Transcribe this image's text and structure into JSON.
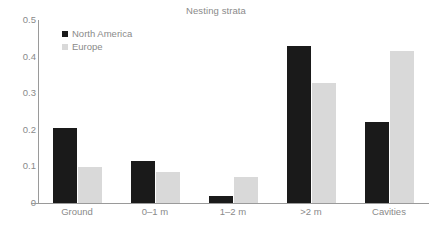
{
  "chart_data": {
    "type": "bar",
    "title": "Nesting strata",
    "xlabel": "",
    "ylabel": "",
    "categories": [
      "Ground",
      "0–1 m",
      "1–2 m",
      ">2 m",
      "Cavities"
    ],
    "series": [
      {
        "name": "North America",
        "color": "#1a1a1a",
        "values": [
          0.205,
          0.115,
          0.018,
          0.429,
          0.222
        ]
      },
      {
        "name": "Europe",
        "color": "#d9d9d9",
        "values": [
          0.098,
          0.085,
          0.071,
          0.327,
          0.414
        ]
      }
    ],
    "ylim": [
      0,
      0.5
    ],
    "yticks": [
      "0",
      "0.1",
      "0.2",
      "0.3",
      "0.4",
      "0.5"
    ],
    "ytick_values": [
      0,
      0.1,
      0.2,
      0.3,
      0.4,
      0.5
    ],
    "grid": false,
    "legend_position": "top-left",
    "axis_color": "#9a9a9a",
    "text_color": "#8a8a8a"
  }
}
